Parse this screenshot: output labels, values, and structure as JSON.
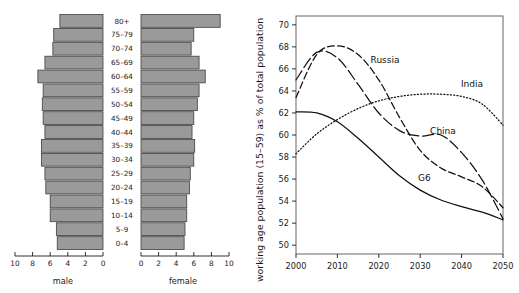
{
  "figure": {
    "title": "",
    "panels": [
      "population-pyramid",
      "working-age-population-line-chart"
    ]
  },
  "chart_data": [
    {
      "id": "population-pyramid",
      "type": "bar",
      "orientation": "horizontal",
      "subtype": "population-pyramid",
      "title": "",
      "xlabel": "",
      "ylabel": "",
      "xlim": [
        0,
        10
      ],
      "grid": false,
      "legend": "none",
      "categories": [
        "0–4",
        "5–9",
        "10–14",
        "15–19",
        "20–24",
        "25–29",
        "30–34",
        "35–39",
        "40–44",
        "45–49",
        "50–54",
        "55–59",
        "60–64",
        "65–69",
        "70–74",
        "75–79",
        "80+"
      ],
      "left_axis_label": "male",
      "right_axis_label": "female",
      "left_tick_labels": [
        "10",
        "8",
        "6",
        "4",
        "2",
        "0"
      ],
      "right_tick_labels": [
        "0",
        "2",
        "4",
        "6",
        "8",
        "10"
      ],
      "tick_values": [
        10,
        8,
        6,
        4,
        2,
        0
      ],
      "series": [
        {
          "name": "male",
          "side": "left",
          "values": [
            5.2,
            5.3,
            6.0,
            6.0,
            6.5,
            6.6,
            7.0,
            7.0,
            6.6,
            6.8,
            6.9,
            6.8,
            7.4,
            6.6,
            5.7,
            5.6,
            4.9
          ]
        },
        {
          "name": "female",
          "side": "right",
          "values": [
            4.9,
            5.0,
            5.2,
            5.2,
            5.5,
            5.6,
            6.0,
            6.1,
            5.8,
            6.0,
            6.4,
            6.6,
            7.3,
            6.6,
            5.7,
            6.0,
            9.0
          ]
        }
      ],
      "bar_fill_color": "#9a9a9a",
      "bar_stroke_color": "#3f3f3f"
    },
    {
      "id": "working-age-population-line-chart",
      "type": "line",
      "title": "",
      "xlabel": "",
      "ylabel": "working age population (15–59) as % of total population",
      "xlim": [
        2000,
        2050
      ],
      "ylim": [
        49.2,
        70.8
      ],
      "xticks": [
        2000,
        2010,
        2020,
        2030,
        2040,
        2050
      ],
      "xtick_labels": [
        "2000",
        "2010",
        "2020",
        "2030",
        "2040",
        "2050"
      ],
      "yticks": [
        50,
        52,
        54,
        56,
        58,
        60,
        62,
        64,
        66,
        68,
        70
      ],
      "ytick_labels": [
        "50",
        "52",
        "54",
        "56",
        "58",
        "60",
        "62",
        "64",
        "66",
        "68",
        "70"
      ],
      "grid": false,
      "legend": "inline-annotations",
      "x": [
        2000,
        2005,
        2010,
        2015,
        2020,
        2025,
        2030,
        2035,
        2040,
        2045,
        2050
      ],
      "series": [
        {
          "name": "Russia",
          "style": "dashed",
          "label_position": {
            "x": 2021.5,
            "y": 66.5
          },
          "values": [
            63.4,
            67.3,
            68.1,
            67.3,
            65.0,
            61.6,
            58.6,
            57.0,
            56.2,
            55.3,
            53.4
          ]
        },
        {
          "name": "China",
          "style": "long-dash",
          "label_position": {
            "x": 2035.5,
            "y": 60.1
          },
          "values": [
            65.0,
            67.5,
            67.0,
            64.6,
            62.0,
            60.4,
            59.9,
            60.0,
            58.4,
            55.9,
            52.4
          ]
        },
        {
          "name": "India",
          "style": "dotted",
          "label_position": {
            "x": 2042.5,
            "y": 64.4
          },
          "values": [
            58.3,
            60.1,
            61.4,
            62.4,
            63.1,
            63.5,
            63.7,
            63.7,
            63.5,
            62.8,
            60.9
          ]
        },
        {
          "name": "G6",
          "style": "solid",
          "label_position": {
            "x": 2031.0,
            "y": 55.8
          },
          "values": [
            62.1,
            62.0,
            61.2,
            59.7,
            58.0,
            56.3,
            55.0,
            54.1,
            53.5,
            53.0,
            52.3
          ]
        }
      ]
    }
  ]
}
